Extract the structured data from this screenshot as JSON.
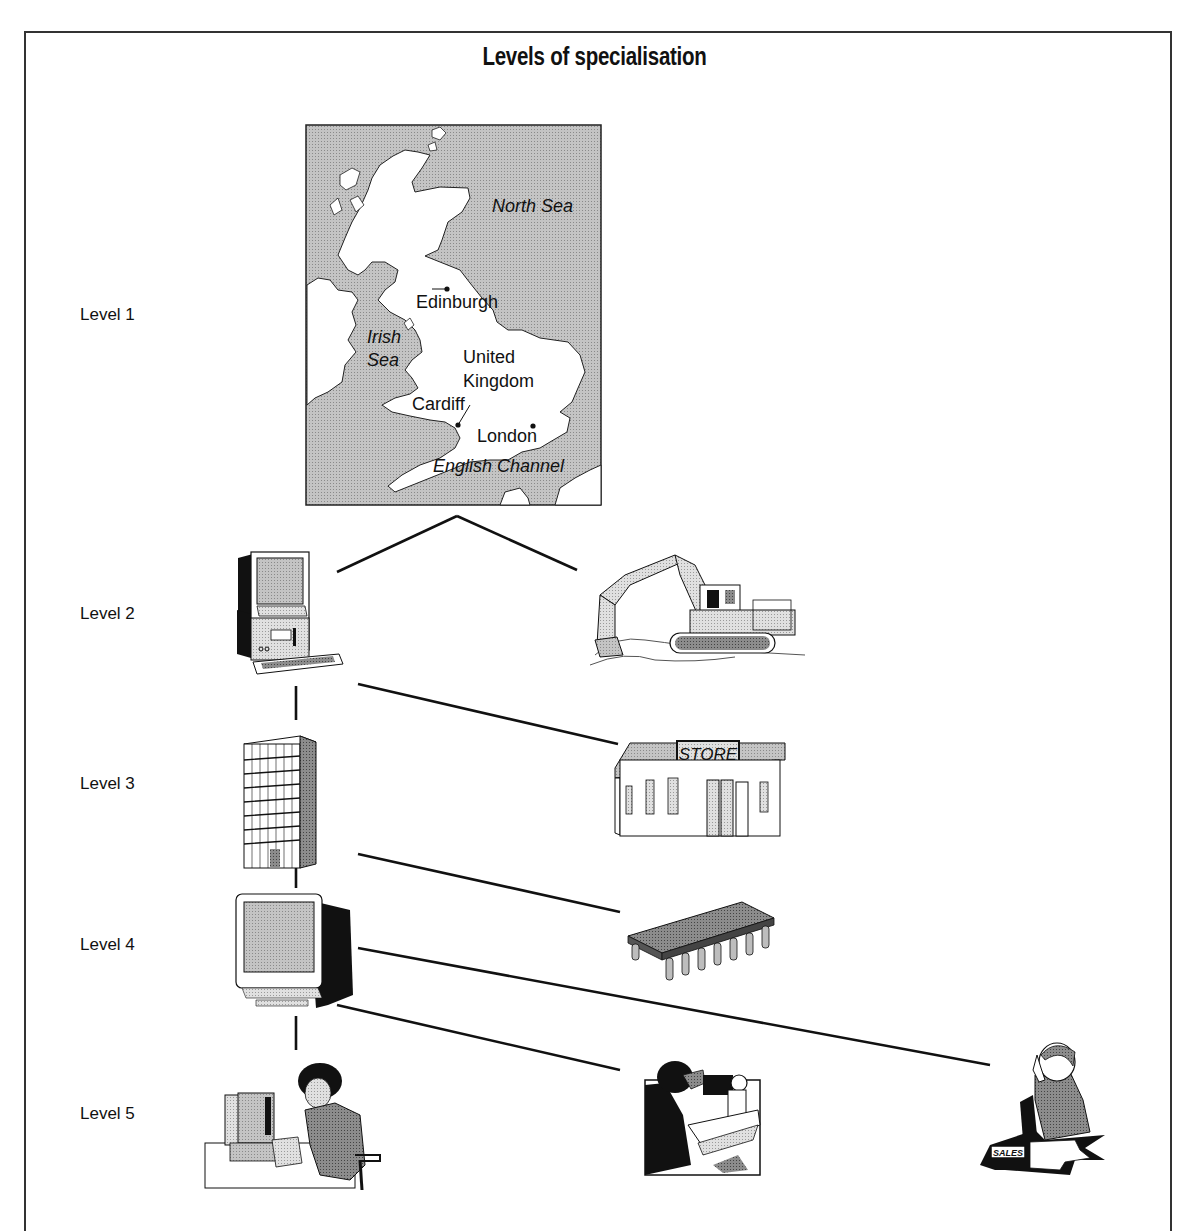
{
  "title": "Levels of specialisation",
  "levels": [
    {
      "label": "Level 1"
    },
    {
      "label": "Level 2"
    },
    {
      "label": "Level 3"
    },
    {
      "label": "Level 4"
    },
    {
      "label": "Level 5"
    }
  ],
  "map": {
    "seas": {
      "north_sea": "North Sea",
      "irish_sea_line1": "Irish",
      "irish_sea_line2": "Sea",
      "english_channel": "English Channel"
    },
    "country_line1": "United",
    "country_line2": "Kingdom",
    "cities": {
      "edinburgh": "Edinburgh",
      "cardiff": "Cardiff",
      "london": "London"
    }
  },
  "illustrations": {
    "store_sign": "STORE",
    "sales_sign": "SALES"
  },
  "nodes": {
    "level1": [
      "uk-map"
    ],
    "level2": [
      "computer-industry",
      "mining-excavator"
    ],
    "level3": [
      "office-building-firm",
      "retail-store"
    ],
    "level4": [
      "monitor-factory",
      "microchip-component"
    ],
    "level5": [
      "office-worker",
      "technician-microscope",
      "sales-telephonist"
    ]
  }
}
